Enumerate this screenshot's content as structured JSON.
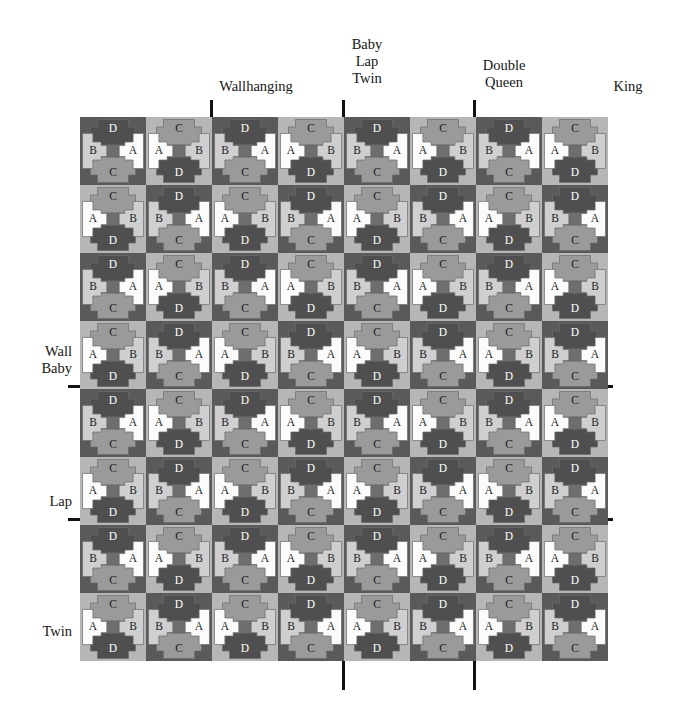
{
  "diagram": {
    "kind": "quilt-block-size-chart"
  },
  "palette": {
    "background_dark": "#5a5a5a",
    "background_light": "#b6b6b6",
    "piece_a_white": "#fbfbfb",
    "piece_b_light": "#cfcfcf",
    "piece_c_mid": "#9a9a9a",
    "piece_d_dark": "#4f4f4f",
    "center_square": "#6e6e6e",
    "outline": "#6b6b6b",
    "rule_black": "#111111",
    "page_white": "#ffffff"
  },
  "top_labels": [
    {
      "text": "Wallhanging",
      "x": 256,
      "y": 78
    },
    {
      "text": "Baby\nLap\nTwin",
      "x": 367,
      "y": 36
    },
    {
      "text": "Double\nQueen",
      "x": 504,
      "y": 57
    },
    {
      "text": "King",
      "x": 628,
      "y": 78
    }
  ],
  "side_labels": [
    {
      "text": "Wall\nBaby",
      "x": 72,
      "y": 343
    },
    {
      "text": "Lap",
      "x": 72,
      "y": 493
    },
    {
      "text": "Twin",
      "x": 72,
      "y": 623
    }
  ],
  "vertical_rules": [
    {
      "name": "wallhanging-rule",
      "x": 210,
      "top": 100,
      "height": 290
    },
    {
      "name": "baby-lap-twin-rule",
      "x": 342,
      "top": 100,
      "height": 590
    },
    {
      "name": "double-queen-rule",
      "x": 473,
      "top": 100,
      "height": 590
    }
  ],
  "horizontal_rules": [
    {
      "name": "wall-baby-rule",
      "y": 385,
      "left": 68,
      "width": 545
    },
    {
      "name": "lap-rule",
      "y": 518,
      "left": 68,
      "width": 545
    }
  ],
  "grid": {
    "origin_x": 80,
    "origin_y": 117,
    "cell_width": 66,
    "cell_height": 68,
    "columns": 8,
    "rows": 8
  },
  "piece_labels": {
    "a": "A",
    "b": "B",
    "c": "C",
    "d": "D"
  },
  "block_variants": {
    "description": "Each cell is a spool/bowtie block. Variant encodes which side piece A sits on, which side the D patch sits, and the cell background shade.",
    "legend": [
      {
        "code": "DR",
        "a_side": "right",
        "d_position": "top",
        "c_position": "bottom",
        "b_side": "left",
        "background": "dark"
      },
      {
        "code": "LL",
        "a_side": "left",
        "d_position": "bottom",
        "c_position": "top",
        "b_side": "right",
        "background": "light"
      },
      {
        "code": "LR",
        "a_side": "right",
        "d_position": "bottom",
        "c_position": "top",
        "b_side": "left",
        "background": "light"
      },
      {
        "code": "DL",
        "a_side": "left",
        "d_position": "top",
        "c_position": "bottom",
        "b_side": "right",
        "background": "dark"
      }
    ]
  },
  "cells": [
    [
      "DR",
      "LL",
      "DR",
      "LL",
      "DR",
      "LL",
      "DR",
      "LL"
    ],
    [
      "LL",
      "DR",
      "LL",
      "DR",
      "LL",
      "DR",
      "LL",
      "DR"
    ],
    [
      "DR",
      "LL",
      "DR",
      "LL",
      "DR",
      "LL",
      "DR",
      "LL"
    ],
    [
      "LL",
      "DR",
      "LL",
      "DR",
      "LL",
      "DR",
      "LL",
      "DR"
    ],
    [
      "DR",
      "LL",
      "DR",
      "LL",
      "DR",
      "LL",
      "DR",
      "LL"
    ],
    [
      "LL",
      "DR",
      "LL",
      "DR",
      "LL",
      "DR",
      "LL",
      "DR"
    ],
    [
      "DR",
      "LL",
      "DR",
      "LL",
      "DR",
      "LL",
      "DR",
      "LL"
    ],
    [
      "LL",
      "DR",
      "LL",
      "DR",
      "LL",
      "DR",
      "LL",
      "DR"
    ]
  ]
}
